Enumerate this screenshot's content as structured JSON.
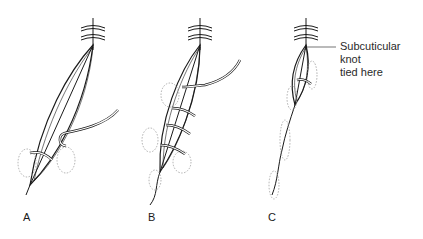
{
  "figure": {
    "panels": [
      {
        "id": "A",
        "label": "A",
        "description": "Suture passed through wound edges near the apex"
      },
      {
        "id": "B",
        "label": "B",
        "description": "Continuous subcuticular suture with multiple passes across the wound"
      },
      {
        "id": "C",
        "label": "C",
        "description": "Wound edges drawn together, suture tightened"
      }
    ],
    "annotation": {
      "line1": "Subcuticular knot",
      "line2": "tied here"
    },
    "colors": {
      "line": "#1a1a1a",
      "dotted": "#9a9a9a",
      "background": "#ffffff"
    }
  }
}
